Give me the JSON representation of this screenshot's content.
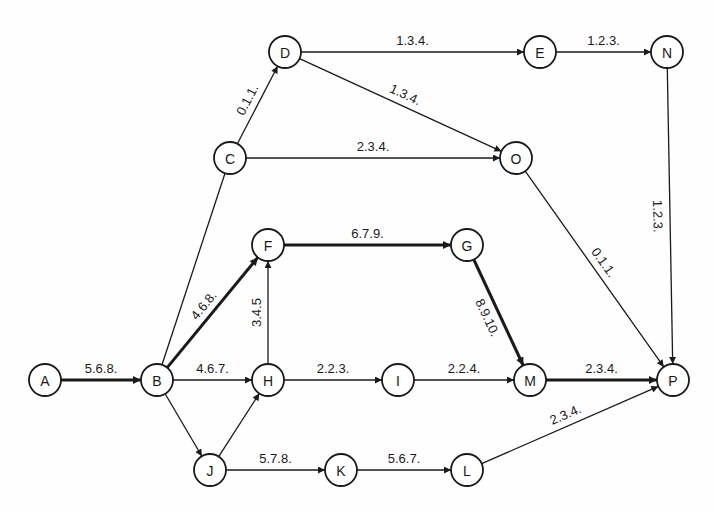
{
  "diagram": {
    "type": "PERT activity network",
    "colors": {
      "ink": "#1a1a1a",
      "background": "#fefefe"
    },
    "nodes": [
      {
        "id": "A",
        "label": "A",
        "x": 45,
        "y": 380
      },
      {
        "id": "B",
        "label": "B",
        "x": 157,
        "y": 380
      },
      {
        "id": "C",
        "label": "C",
        "x": 230,
        "y": 158
      },
      {
        "id": "D",
        "label": "D",
        "x": 285,
        "y": 52
      },
      {
        "id": "E",
        "label": "E",
        "x": 540,
        "y": 52
      },
      {
        "id": "N",
        "label": "N",
        "x": 667,
        "y": 52
      },
      {
        "id": "O",
        "label": "O",
        "x": 516,
        "y": 158
      },
      {
        "id": "F",
        "label": "F",
        "x": 268,
        "y": 245
      },
      {
        "id": "G",
        "label": "G",
        "x": 467,
        "y": 245
      },
      {
        "id": "H",
        "label": "H",
        "x": 268,
        "y": 380
      },
      {
        "id": "I",
        "label": "I",
        "x": 398,
        "y": 380
      },
      {
        "id": "M",
        "label": "M",
        "x": 530,
        "y": 380
      },
      {
        "id": "P",
        "label": "P",
        "x": 673,
        "y": 380
      },
      {
        "id": "J",
        "label": "J",
        "x": 210,
        "y": 470
      },
      {
        "id": "K",
        "label": "K",
        "x": 341,
        "y": 470
      },
      {
        "id": "L",
        "label": "L",
        "x": 467,
        "y": 470
      }
    ],
    "edges": [
      {
        "from": "A",
        "to": "B",
        "label": "5.6.8.",
        "critical": true
      },
      {
        "from": "B",
        "to": "C",
        "label": "",
        "critical": false,
        "arrow": false
      },
      {
        "from": "C",
        "to": "D",
        "label": "0.1.1.",
        "critical": false
      },
      {
        "from": "D",
        "to": "E",
        "label": "1.3.4.",
        "critical": false
      },
      {
        "from": "E",
        "to": "N",
        "label": "1.2.3.",
        "critical": false
      },
      {
        "from": "D",
        "to": "O",
        "label": "1.3.4.",
        "critical": false
      },
      {
        "from": "C",
        "to": "O",
        "label": "2.3.4.",
        "critical": false
      },
      {
        "from": "O",
        "to": "P",
        "label": "0.1.1.",
        "critical": false
      },
      {
        "from": "N",
        "to": "P",
        "label": "1.2.3.",
        "critical": false
      },
      {
        "from": "B",
        "to": "F",
        "label": "4.6.8.",
        "critical": true
      },
      {
        "from": "F",
        "to": "G",
        "label": "6.7.9.",
        "critical": true
      },
      {
        "from": "G",
        "to": "M",
        "label": "8.9.10.",
        "critical": true
      },
      {
        "from": "B",
        "to": "H",
        "label": "4.6.7.",
        "critical": false
      },
      {
        "from": "H",
        "to": "F",
        "label": "3.4.5",
        "critical": false
      },
      {
        "from": "H",
        "to": "I",
        "label": "2.2.3.",
        "critical": false
      },
      {
        "from": "I",
        "to": "M",
        "label": "2.2.4.",
        "critical": false
      },
      {
        "from": "M",
        "to": "P",
        "label": "2.3.4.",
        "critical": true
      },
      {
        "from": "B",
        "to": "J",
        "label": "",
        "critical": false
      },
      {
        "from": "J",
        "to": "H",
        "label": "",
        "critical": false
      },
      {
        "from": "J",
        "to": "K",
        "label": "5.7.8.",
        "critical": false
      },
      {
        "from": "K",
        "to": "L",
        "label": "5.6.7.",
        "critical": false
      },
      {
        "from": "L",
        "to": "P",
        "label": "2.3.4.",
        "critical": false
      }
    ]
  }
}
